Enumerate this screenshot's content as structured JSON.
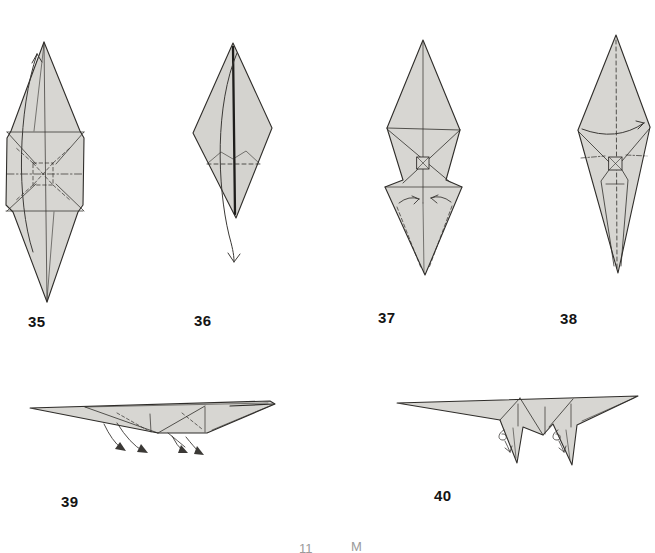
{
  "page": {
    "background_color": "#ffffff",
    "paper_fill": "#d7d6d2",
    "line_color": "#2f2d2a",
    "arrow_color": "#3b3936",
    "label_color": "#141414"
  },
  "steps": [
    {
      "label": "35"
    },
    {
      "label": "36"
    },
    {
      "label": "37"
    },
    {
      "label": "38"
    },
    {
      "label": "39"
    },
    {
      "label": "40"
    }
  ],
  "footer": {
    "left_fragment": "11",
    "right_fragment": "M"
  }
}
